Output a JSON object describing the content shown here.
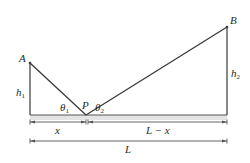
{
  "diagram": {
    "type": "geometry-reflection",
    "points": {
      "A": {
        "label": "A",
        "x": 30,
        "y": 63
      },
      "P": {
        "label": "P",
        "x": 86,
        "y": 115
      },
      "B": {
        "label": "B",
        "x": 227,
        "y": 27
      }
    },
    "heights": {
      "h1": {
        "label": "h",
        "sub": "1"
      },
      "h2": {
        "label": "h",
        "sub": "2"
      }
    },
    "angles": {
      "theta1": {
        "label": "θ",
        "sub": "1"
      },
      "theta2": {
        "label": "θ",
        "sub": "2"
      }
    },
    "dimensions": {
      "x": {
        "label": "x"
      },
      "L_minus_x": {
        "label": "L − x"
      },
      "L": {
        "label": "L"
      }
    },
    "colors": {
      "line": "#3a3a3a",
      "ground_fill": "#e4e4e4",
      "ground_edge": "#555555",
      "text": "#2a2a2a"
    }
  }
}
